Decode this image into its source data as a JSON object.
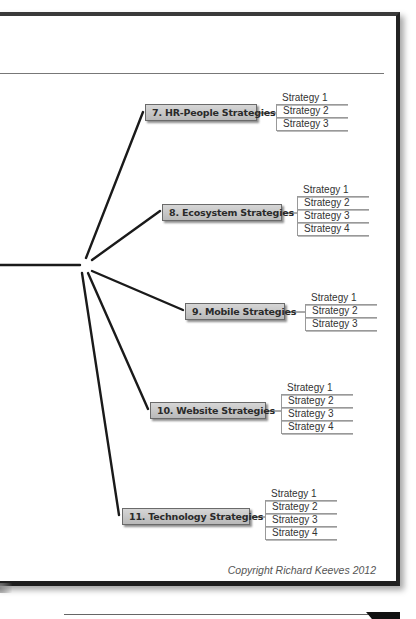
{
  "diagram": {
    "type": "mind-map-branch",
    "hub": {
      "x": 86,
      "y": 266
    },
    "incoming_line": {
      "from_x": 0,
      "to_x": 80,
      "y": 265
    },
    "branches": [
      {
        "label": "7. HR-People Strategies",
        "node": {
          "x": 145,
          "y": 104,
          "w": 112
        },
        "line_end": {
          "x": 143,
          "y": 112
        },
        "line_start": {
          "x": 86,
          "y": 258
        },
        "subs_pos": {
          "x": 276,
          "y": 92
        },
        "strategies": [
          "Strategy 1",
          "Strategy 2",
          "Strategy 3"
        ]
      },
      {
        "label": "8. Ecosystem Strategies",
        "node": {
          "x": 162,
          "y": 204,
          "w": 120
        },
        "line_end": {
          "x": 160,
          "y": 211
        },
        "line_start": {
          "x": 92,
          "y": 260
        },
        "subs_pos": {
          "x": 297,
          "y": 184
        },
        "strategies": [
          "Strategy 1",
          "Strategy 2",
          "Strategy 3",
          "Strategy 4"
        ]
      },
      {
        "label": "9. Mobile Strategies",
        "node": {
          "x": 185,
          "y": 303,
          "w": 100
        },
        "line_end": {
          "x": 183,
          "y": 310
        },
        "line_start": {
          "x": 92,
          "y": 271
        },
        "subs_pos": {
          "x": 305,
          "y": 292
        },
        "strategies": [
          "Strategy 1",
          "Strategy 2",
          "Strategy 3"
        ]
      },
      {
        "label": "10. Website Strategies",
        "node": {
          "x": 150,
          "y": 402,
          "w": 116
        },
        "line_end": {
          "x": 148,
          "y": 409
        },
        "line_start": {
          "x": 88,
          "y": 273
        },
        "subs_pos": {
          "x": 281,
          "y": 382
        },
        "strategies": [
          "Strategy 1",
          "Strategy 2",
          "Strategy 3",
          "Strategy 4"
        ]
      },
      {
        "label": "11. Technology Strategies",
        "node": {
          "x": 122,
          "y": 508,
          "w": 128
        },
        "line_end": {
          "x": 119,
          "y": 515
        },
        "line_start": {
          "x": 82,
          "y": 273
        },
        "subs_pos": {
          "x": 265,
          "y": 488
        },
        "strategies": [
          "Strategy 1",
          "Strategy 2",
          "Strategy 3",
          "Strategy 4"
        ]
      }
    ]
  },
  "footer": {
    "copyright": "Copyright Richard Keeves 2012"
  },
  "colors": {
    "line": "#1a1a1a",
    "node_fill_top": "#d6d6d6",
    "node_fill_bottom": "#b9b9b9",
    "frame": "#2a2a2a"
  }
}
